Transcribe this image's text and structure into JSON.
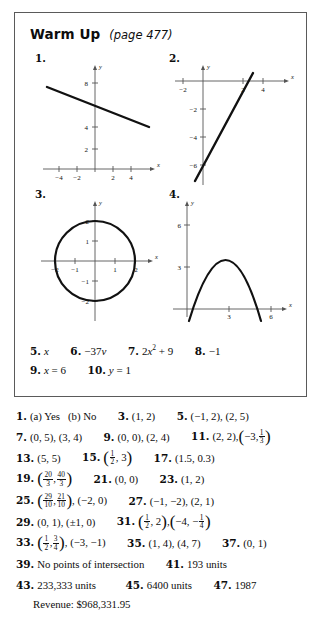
{
  "warmup": {
    "title": "Warm Up",
    "page_ref": "(page 477)",
    "graphs": [
      {
        "number": "1.",
        "type": "line",
        "x_ticks": [
          "-4",
          "-2",
          "2",
          "4"
        ],
        "y_ticks": [
          "2",
          "4",
          "8"
        ],
        "x_axis_label": "x",
        "y_axis_label": "y",
        "description": "line with negative slope, y-intercept 6",
        "slope": -0.35,
        "intercept": 6
      },
      {
        "number": "2.",
        "type": "line",
        "x_ticks": [
          "-2",
          "2",
          "4"
        ],
        "y_ticks": [
          "-2",
          "-4",
          "-6"
        ],
        "x_axis_label": "x",
        "y_axis_label": "y",
        "description": "steep line with positive slope, y-intercept -6, x-intercept 2.4",
        "slope": 2.5,
        "intercept": -6
      },
      {
        "number": "3.",
        "type": "circle",
        "x_ticks": [
          "-2",
          "-1",
          "1",
          "2"
        ],
        "y_ticks": [
          "-2",
          "-1",
          "1",
          "2"
        ],
        "x_axis_label": "x",
        "y_axis_label": "y",
        "description": "circle centered at origin, radius 2",
        "radius": 2
      },
      {
        "number": "4.",
        "type": "parabola",
        "x_ticks": [
          "3",
          "6"
        ],
        "y_ticks": [
          "3",
          "6"
        ],
        "x_axis_label": "x",
        "y_axis_label": "y",
        "description": "downward parabola, roots near 0.3 and 5.3, vertex near (2.8, 5.5)",
        "roots": [
          0.3,
          5.3
        ],
        "vertex": [
          2.8,
          5.5
        ]
      }
    ],
    "answers_line1": [
      {
        "num": "5.",
        "value": "x"
      },
      {
        "num": "6.",
        "value": "-37v"
      },
      {
        "num": "7.",
        "value": "2x2 + 9"
      },
      {
        "num": "8.",
        "value": "-1"
      }
    ],
    "answers_line2": [
      {
        "num": "9.",
        "value": "x = 6"
      },
      {
        "num": "10.",
        "value": "y = 1"
      }
    ]
  },
  "answer_list": {
    "row1": {
      "n1": "1.",
      "a1": "(a) Yes",
      "a2": "(b) No",
      "n3": "3.",
      "a3": "(1, 2)",
      "n5": "5.",
      "a5": "(−1, 2), (2, 5)"
    },
    "row2": {
      "n7": "7.",
      "a7": "(0, 5), (3, 4)",
      "n9": "9.",
      "a9": "(0, 0), (2, 4)",
      "n11": "11.",
      "a11_first": "(2, 2),",
      "a11_pair_x": "−3,",
      "a11_frac_num": "1",
      "a11_frac_den": "3"
    },
    "row3": {
      "n13": "13.",
      "a13": "(5, 5)",
      "n15": "15.",
      "a15_frac_num": "1",
      "a15_frac_den": "2",
      "a15_second": ", 3",
      "n17": "17.",
      "a17": "(1.5, 0.3)"
    },
    "row4": {
      "n19": "19.",
      "a19_f1_num": "20",
      "a19_f1_den": "3",
      "a19_sep": ",",
      "a19_f2_num": "40",
      "a19_f2_den": "3",
      "n21": "21.",
      "a21": "(0, 0)",
      "n23": "23.",
      "a23": "(1, 2)"
    },
    "row5": {
      "n25": "25.",
      "a25_f1_num": "29",
      "a25_f1_den": "10",
      "a25_sep": ",",
      "a25_f2_num": "21",
      "a25_f2_den": "10",
      "a25_tail": ", (−2, 0)",
      "n27": "27.",
      "a27": "(−1, −2), (2, 1)"
    },
    "row6": {
      "n29": "29.",
      "a29": "(0, 1), (±1, 0)",
      "n31": "31.",
      "a31_f1_num": "1",
      "a31_f1_den": "2",
      "a31_tail1": ", 2",
      "a31_mid": ",",
      "a31_x2": "−4, −",
      "a31_f2_num": "1",
      "a31_f2_den": "4"
    },
    "row7": {
      "n33": "33.",
      "a33_f1_num": "1",
      "a33_f1_den": "2",
      "a33_sep": ",",
      "a33_f2_num": "3",
      "a33_f2_den": "4",
      "a33_tail": ", (−3, −1)",
      "n35": "35.",
      "a35": "(1, 4), (4, 7)",
      "n37": "37.",
      "a37": "(0, 1)"
    },
    "row8": {
      "n39": "39.",
      "a39": "No points of intersection",
      "n41": "41.",
      "a41": "193 units"
    },
    "row9": {
      "n43": "43.",
      "a43": "233,333 units",
      "n45": "45.",
      "a45": "6400 units",
      "n47": "47.",
      "a47": "1987"
    },
    "row10": {
      "a43_sub": "Revenue: $968,331.95"
    }
  }
}
